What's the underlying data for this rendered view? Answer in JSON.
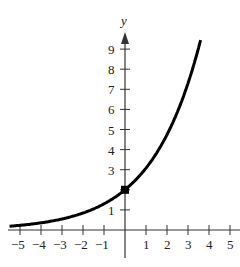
{
  "chart_data": {
    "type": "line",
    "title": "",
    "xlabel": "",
    "ylabel": "y",
    "xlim": [
      -5.5,
      5.2
    ],
    "ylim": [
      -1,
      10
    ],
    "x_ticks": [
      -5,
      -4,
      -3,
      -2,
      -1,
      1,
      2,
      3,
      4,
      5
    ],
    "x_tick_labels": [
      "−5",
      "−4",
      "−3",
      "−2",
      "−1",
      "1",
      "2",
      "3",
      "4",
      "5"
    ],
    "y_ticks": [
      1,
      2,
      3,
      4,
      5,
      6,
      7,
      8,
      9
    ],
    "y_tick_labels": [
      "1",
      "",
      "3",
      "4",
      "5",
      "6",
      "7",
      "8",
      "9"
    ],
    "grid": false,
    "series": [
      {
        "name": "exponential curve",
        "x": [
          -5.5,
          -5,
          -4,
          -3,
          -2,
          -1,
          0,
          1,
          2,
          3,
          3.6
        ],
        "values": [
          0.19,
          0.23,
          0.36,
          0.55,
          0.84,
          1.3,
          2.0,
          3.08,
          4.74,
          7.3,
          9.45
        ]
      }
    ],
    "annotations": [
      {
        "type": "point",
        "x": 0,
        "y": 2,
        "marker": "filled-square"
      }
    ]
  }
}
